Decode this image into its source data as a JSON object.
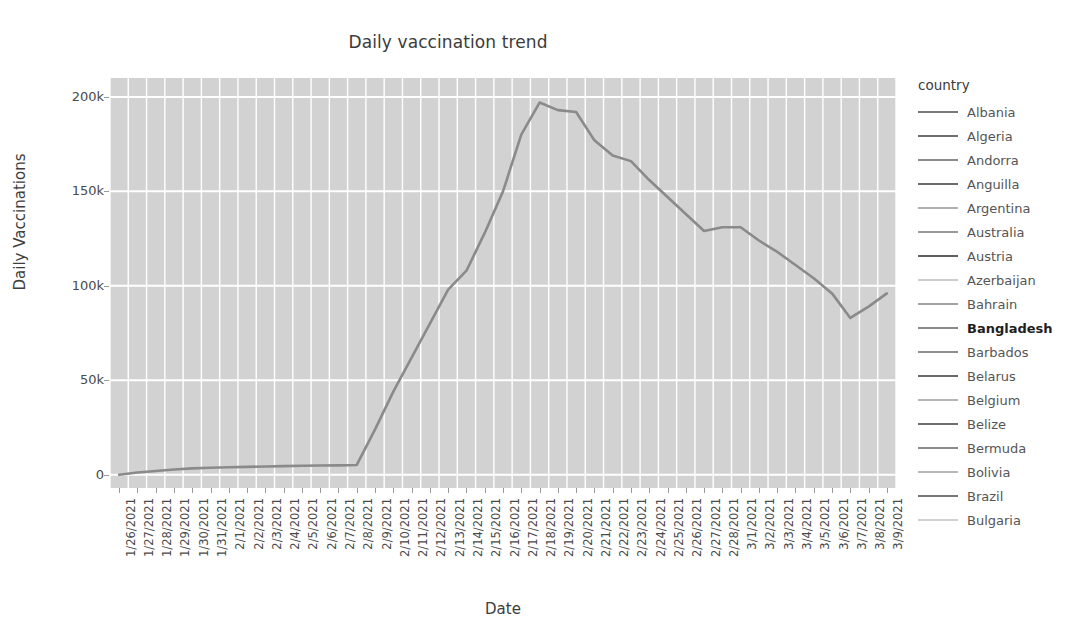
{
  "chart_data": {
    "type": "line",
    "title": "Daily vaccination trend",
    "xlabel": "Date",
    "ylabel": "Daily Vaccinations",
    "grid": true,
    "legend_position": "right",
    "legend_title": "country",
    "highlighted_series": "Bangladesh",
    "ylim": [
      -7000,
      210000
    ],
    "y_ticks": [
      0,
      50000,
      100000,
      150000,
      200000
    ],
    "y_tick_labels": [
      "0",
      "50k",
      "100k",
      "150k",
      "200k"
    ],
    "categories": [
      "1/26/2021",
      "1/27/2021",
      "1/28/2021",
      "1/29/2021",
      "1/30/2021",
      "1/31/2021",
      "2/1/2021",
      "2/2/2021",
      "2/3/2021",
      "2/4/2021",
      "2/5/2021",
      "2/6/2021",
      "2/7/2021",
      "2/8/2021",
      "2/9/2021",
      "2/10/2021",
      "2/11/2021",
      "2/12/2021",
      "2/13/2021",
      "2/14/2021",
      "2/15/2021",
      "2/16/2021",
      "2/17/2021",
      "2/18/2021",
      "2/19/2021",
      "2/20/2021",
      "2/21/2021",
      "2/22/2021",
      "2/23/2021",
      "2/24/2021",
      "2/25/2021",
      "2/26/2021",
      "2/27/2021",
      "2/28/2021",
      "3/1/2021",
      "3/2/2021",
      "3/3/2021",
      "3/4/2021",
      "3/5/2021",
      "3/6/2021",
      "3/7/2021",
      "3/8/2021",
      "3/9/2021"
    ],
    "series": [
      {
        "name": "Bangladesh",
        "color": "#8a8a8a",
        "values": [
          0,
          1200,
          2000,
          2800,
          3400,
          3700,
          4000,
          4200,
          4400,
          4600,
          4800,
          4900,
          5000,
          5200,
          24000,
          44000,
          62000,
          80000,
          98000,
          108000,
          128000,
          150000,
          180000,
          197000,
          193000,
          192000,
          177000,
          169000,
          166000,
          156000,
          147000,
          138000,
          129000,
          131000,
          131000,
          124000,
          118000,
          111000,
          104000,
          96000,
          83000,
          89000,
          96000
        ]
      }
    ]
  },
  "legend": {
    "title": "country",
    "items": [
      {
        "label": "Albania",
        "color": "#7a7a7a",
        "highlighted": false
      },
      {
        "label": "Algeria",
        "color": "#6f6f6f",
        "highlighted": false
      },
      {
        "label": "Andorra",
        "color": "#8c8c8c",
        "highlighted": false
      },
      {
        "label": "Anguilla",
        "color": "#6b6b6b",
        "highlighted": false
      },
      {
        "label": "Argentina",
        "color": "#b0b0b0",
        "highlighted": false
      },
      {
        "label": "Australia",
        "color": "#9b9b9b",
        "highlighted": false
      },
      {
        "label": "Austria",
        "color": "#5f5f5f",
        "highlighted": false
      },
      {
        "label": "Azerbaijan",
        "color": "#cccccc",
        "highlighted": false
      },
      {
        "label": "Bahrain",
        "color": "#a3a3a3",
        "highlighted": false
      },
      {
        "label": "Bangladesh",
        "color": "#8a8a8a",
        "highlighted": true
      },
      {
        "label": "Barbados",
        "color": "#8f8f8f",
        "highlighted": false
      },
      {
        "label": "Belarus",
        "color": "#6a6a6a",
        "highlighted": false
      },
      {
        "label": "Belgium",
        "color": "#b5b5b5",
        "highlighted": false
      },
      {
        "label": "Belize",
        "color": "#6e6e6e",
        "highlighted": false
      },
      {
        "label": "Bermuda",
        "color": "#8b8b8b",
        "highlighted": false
      },
      {
        "label": "Bolivia",
        "color": "#b8b8b8",
        "highlighted": false
      },
      {
        "label": "Brazil",
        "color": "#777777",
        "highlighted": false
      },
      {
        "label": "Bulgaria",
        "color": "#d0d0d0",
        "highlighted": false
      }
    ]
  },
  "theme": {
    "plot_background": "#d2d2d2",
    "grid_color": "#ffffff",
    "line_color": "#8a8a8a",
    "text_color": "#4a4a4a"
  }
}
